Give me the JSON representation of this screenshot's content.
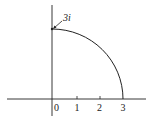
{
  "figure": {
    "x_axis": {
      "tick_labels": [
        "0",
        "1",
        "2",
        "3"
      ]
    },
    "arc": {
      "start_label": "3i",
      "radius": 3,
      "start": "3i",
      "end": "3"
    },
    "colors": {
      "stroke": "#222222",
      "background": "#ffffff"
    }
  }
}
